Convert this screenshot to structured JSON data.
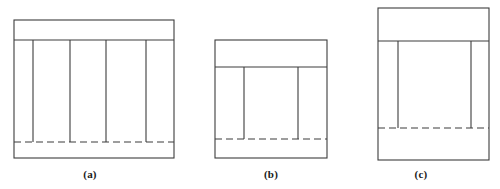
{
  "figure": {
    "background_color": "#ffffff",
    "line_color": "#3c3c3c",
    "solid_stroke_width": 1.1,
    "dashed_stroke_width": 1.1,
    "dash_pattern": "7,4",
    "panels": [
      {
        "id": "a",
        "caption": "(a)",
        "outer": {
          "x": 14,
          "y": 20,
          "width": 160,
          "height": 138
        },
        "top_band_line_y": 40,
        "dashed_line_y": 142,
        "interior_vertical_x": [
          33,
          70,
          106,
          146
        ],
        "interior_vertical_count": 4,
        "interior_vertical_top": 40,
        "interior_vertical_bottom": 142
      },
      {
        "id": "b",
        "caption": "(b)",
        "outer": {
          "x": 215,
          "y": 40,
          "width": 112,
          "height": 118
        },
        "top_band_line_y": 67,
        "dashed_line_y": 139,
        "interior_vertical_x": [
          244,
          298
        ],
        "interior_vertical_count": 2,
        "interior_vertical_top": 67,
        "interior_vertical_bottom": 139
      },
      {
        "id": "c",
        "caption": "(c)",
        "outer": {
          "x": 378,
          "y": 8,
          "width": 111,
          "height": 152
        },
        "top_band_line_y": 41,
        "dashed_line_y": 128,
        "interior_vertical_x": [
          398,
          471
        ],
        "interior_vertical_count": 2,
        "interior_vertical_top": 41,
        "interior_vertical_bottom": 128
      }
    ]
  },
  "captions": {
    "a": "(a)",
    "b": "(b)",
    "c": "(c)"
  }
}
